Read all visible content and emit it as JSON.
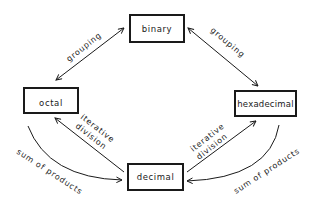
{
  "diagram": {
    "type": "number-system-conversion",
    "nodes": [
      {
        "id": "binary",
        "label": "binary"
      },
      {
        "id": "octal",
        "label": "octal"
      },
      {
        "id": "hexadecimal",
        "label": "hexadecimal"
      },
      {
        "id": "decimal",
        "label": "decimal"
      }
    ],
    "edges": [
      {
        "from": "binary",
        "to": "octal",
        "label": "grouping",
        "direction": "both"
      },
      {
        "from": "binary",
        "to": "hexadecimal",
        "label": "grouping",
        "direction": "both"
      },
      {
        "from": "decimal",
        "to": "octal",
        "label": "iterative division",
        "label_lines": [
          "iterative",
          "division"
        ],
        "direction": "forward"
      },
      {
        "from": "decimal",
        "to": "hexadecimal",
        "label": "iterative division",
        "label_lines": [
          "iterative",
          "division"
        ],
        "direction": "forward"
      },
      {
        "from": "octal",
        "to": "decimal",
        "label": "sum of products",
        "direction": "forward"
      },
      {
        "from": "hexadecimal",
        "to": "decimal",
        "label": "sum of products",
        "direction": "forward"
      }
    ]
  },
  "labels": {
    "binary": "binary",
    "octal": "octal",
    "hexadecimal": "hexadecimal",
    "decimal": "decimal",
    "grouping_left": "grouping",
    "grouping_right": "grouping",
    "iter_left_1": "iterative",
    "iter_left_2": "division",
    "iter_right_1": "iterative",
    "iter_right_2": "division",
    "sum_left": "sum of products",
    "sum_right": "sum of products"
  }
}
